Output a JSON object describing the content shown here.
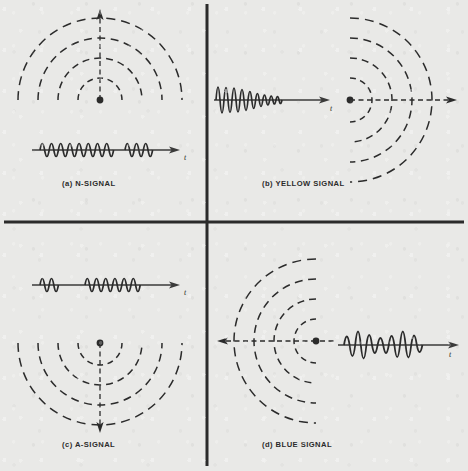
{
  "figure": {
    "background_color": "#e9e9e7",
    "ink_color": "#2b2b2b",
    "divider": {
      "name": "quadrant-divider-cross",
      "vertical_x": 207,
      "horizontal_y": 222,
      "stroke_width": 3
    }
  },
  "quadrants": [
    {
      "id": "a",
      "label_index": "(a)",
      "label_text": "N-SIGNAL",
      "caption": "(a)   N-SIGNAL",
      "caption_x": 62,
      "caption_y": 186,
      "propagation_direction": "up",
      "source_dot": {
        "x": 100,
        "y": 100,
        "r": 3.4
      },
      "arrow_tip": {
        "x": 100,
        "y": 11
      },
      "arc_count": 4,
      "arc_radii": [
        22,
        42,
        62,
        82
      ],
      "arc_opening": "upward",
      "waveform": {
        "name": "n-signal-waveform",
        "axis_y": 150,
        "axis_x_start": 32,
        "axis_x_end": 178,
        "t_label": "t",
        "t_label_x": 184,
        "t_label_y": 160,
        "description": "long burst of 8 cycles, gap, then short burst of 2.5 cycles",
        "bursts": [
          {
            "start_x": 40,
            "cycles": 8,
            "period": 9.2,
            "amplitude": 13
          },
          {
            "start_x": 125,
            "cycles": 2.5,
            "period": 9.2,
            "amplitude": 13
          }
        ]
      }
    },
    {
      "id": "b",
      "label_index": "(b)",
      "label_text": "YELLOW SIGNAL",
      "caption": "(b)   YELLOW SIGNAL",
      "caption_x": 262,
      "caption_y": 186,
      "propagation_direction": "right",
      "source_dot": {
        "x": 350,
        "y": 100,
        "r": 3.4
      },
      "arrow_tip": {
        "x": 455,
        "y": 100
      },
      "arc_count": 4,
      "arc_radii": [
        22,
        42,
        62,
        82
      ],
      "arc_opening": "rightward",
      "waveform": {
        "name": "yellow-signal-waveform",
        "axis_y": 100,
        "axis_x_start": 214,
        "axis_x_end": 330,
        "t_label": "t",
        "t_label_x": 330,
        "t_label_y": 110,
        "description": "decaying oscillation, large amplitude at left tapering to the right",
        "bursts": [
          {
            "start_x": 216,
            "cycles": 9,
            "period": 8.0,
            "amplitude": 26,
            "decay": true
          }
        ]
      }
    },
    {
      "id": "c",
      "label_index": "(c)",
      "label_text": "A-SIGNAL",
      "caption": "(c)   A-SIGNAL",
      "caption_x": 62,
      "caption_y": 447,
      "propagation_direction": "down",
      "source_dot": {
        "x": 100,
        "y": 343,
        "r": 3.4
      },
      "arrow_tip": {
        "x": 100,
        "y": 432
      },
      "arc_count": 4,
      "arc_radii": [
        22,
        42,
        62,
        82
      ],
      "arc_opening": "downward",
      "waveform": {
        "name": "a-signal-waveform",
        "axis_y": 285,
        "axis_x_start": 32,
        "axis_x_end": 178,
        "t_label": "t",
        "t_label_x": 184,
        "t_label_y": 295,
        "description": "short burst of 2 cycles, gap, then long burst of 6 cycles",
        "bursts": [
          {
            "start_x": 40,
            "cycles": 2,
            "period": 9.2,
            "amplitude": 13
          },
          {
            "start_x": 85,
            "cycles": 6,
            "period": 9.2,
            "amplitude": 13
          }
        ]
      }
    },
    {
      "id": "d",
      "label_index": "(d)",
      "label_text": "BLUE SIGNAL",
      "caption": "(d)   BLUE SIGNAL",
      "caption_x": 262,
      "caption_y": 447,
      "propagation_direction": "left",
      "source_dot": {
        "x": 316,
        "y": 341,
        "r": 3.4
      },
      "arrow_tip": {
        "x": 218,
        "y": 341
      },
      "arc_count": 4,
      "arc_radii": [
        22,
        42,
        62,
        82
      ],
      "arc_opening": "leftward",
      "waveform": {
        "name": "blue-signal-waveform",
        "axis_y": 345,
        "axis_x_start": 338,
        "axis_x_end": 458,
        "t_label": "t",
        "t_label_x": 448,
        "t_label_y": 357,
        "description": "amplitude-modulated burst: peaks, dips mid-way, peaks again",
        "bursts": [
          {
            "start_x": 342,
            "cycles": 7,
            "period": 11.0,
            "amplitude": 24,
            "modulated": true
          }
        ]
      }
    }
  ]
}
